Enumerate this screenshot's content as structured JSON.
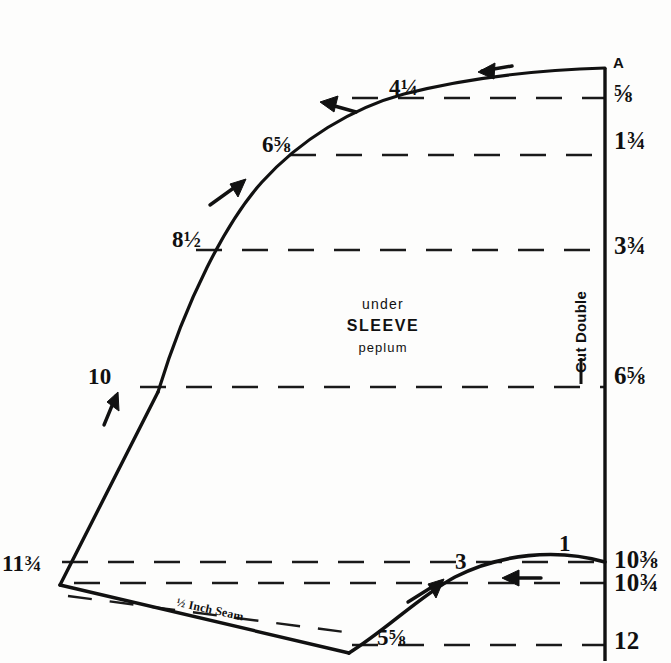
{
  "document": {
    "type": "sewing-pattern-draft",
    "title": "under SLEEVE peplum",
    "ink_color": "#111111",
    "paper_color": "#fdfdfc"
  },
  "center_label": {
    "line1": "under",
    "line2": "SLEEVE",
    "line3": "peplum"
  },
  "corner_label": {
    "point_a": "A"
  },
  "grainline": {
    "text": "Cut Double"
  },
  "seam_note": {
    "text": "½ Inch Seam"
  },
  "edge_measurements": [
    {
      "name": "top-curve-4-1-4",
      "text": "4¼",
      "x": 389,
      "y": 76
    },
    {
      "name": "top-curve-6-5-8",
      "text": "6⅝",
      "x": 262,
      "y": 133
    },
    {
      "name": "left-curve-8-1-2",
      "text": "8½",
      "x": 172,
      "y": 228
    },
    {
      "name": "left-edge-10",
      "text": "10",
      "x": 88,
      "y": 365
    },
    {
      "name": "left-corner-11-3-4",
      "text": "11¾",
      "x": 2,
      "y": 552
    },
    {
      "name": "bottom-curve-5-5-8",
      "text": "5⅝",
      "x": 377,
      "y": 626
    },
    {
      "name": "bottom-curve-3",
      "text": "3",
      "x": 455,
      "y": 550
    },
    {
      "name": "bottom-curve-1",
      "text": "1",
      "x": 559,
      "y": 532
    }
  ],
  "right_scale": [
    {
      "name": "scale-5-8",
      "text": "⅝",
      "y": 81
    },
    {
      "name": "scale-1-3-4",
      "text": "1¾",
      "y": 128
    },
    {
      "name": "scale-3-3-4",
      "text": "3¾",
      "y": 233
    },
    {
      "name": "scale-6-5-8",
      "text": "6⅝",
      "y": 363
    },
    {
      "name": "scale-10-3-8",
      "text": "10⅜",
      "y": 547
    },
    {
      "name": "scale-10-3-4",
      "text": "10¾",
      "y": 570
    },
    {
      "name": "scale-12",
      "text": "12",
      "y": 628
    }
  ],
  "geometry": {
    "fold_line": {
      "x": 605,
      "y_top": 68,
      "y_bottom": 661
    },
    "dashed_rules": [
      98,
      155,
      250,
      387,
      562,
      583,
      645
    ],
    "dash_left_limits": [
      352,
      290,
      196,
      140,
      62,
      74,
      352
    ]
  },
  "chart_data": {
    "type": "line",
    "title": "under SLEEVE peplum",
    "xlabel": "",
    "ylabel": "",
    "axis_units": "inches",
    "right_scale_ticks": [
      "5/8",
      "1 3/4",
      "3 3/4",
      "6 5/8",
      "10 3/8",
      "10 3/4",
      "12"
    ],
    "edge_labels": [
      "4 1/4",
      "6 5/8",
      "8 1/2",
      "10",
      "11 3/4",
      "5 5/8",
      "3",
      "1"
    ],
    "annotations": [
      "A",
      "Cut Double",
      "1/2 Inch Seam",
      "under",
      "SLEEVE",
      "peplum"
    ],
    "grid": "horizontal-dashed",
    "legend": "none"
  }
}
